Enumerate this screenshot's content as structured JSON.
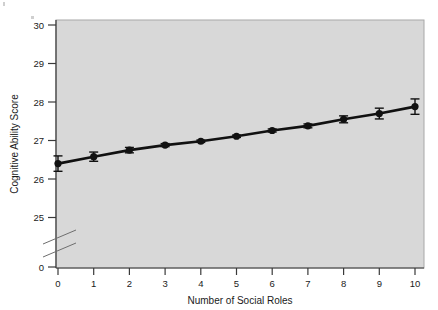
{
  "figure": {
    "background_color": "#ffffff",
    "plot_background_color": "#d8d8d8",
    "plot_border_color": "#9a9a9a",
    "axis_color": "#3a3a3a",
    "series_color": "#111111"
  },
  "axes": {
    "x_title": "Number of Social Roles",
    "y_title": "Cognitive Ability Score",
    "x_ticks": [
      "0",
      "1",
      "2",
      "3",
      "4",
      "5",
      "6",
      "7",
      "8",
      "9",
      "10"
    ],
    "y_ticks": [
      "30",
      "29",
      "28",
      "27",
      "26",
      "25",
      "0"
    ],
    "y_axis_break": true
  },
  "chart_data": {
    "type": "line",
    "title": "",
    "subtitle": "",
    "xlabel": "Number of Social Roles",
    "ylabel": "Cognitive Ability Score",
    "x": [
      0,
      1,
      2,
      3,
      4,
      5,
      6,
      7,
      8,
      9,
      10
    ],
    "values": [
      26.4,
      26.58,
      26.75,
      26.88,
      26.98,
      27.11,
      27.26,
      27.38,
      27.55,
      27.7,
      27.88
    ],
    "error_bars": [
      0.2,
      0.12,
      0.07,
      0.04,
      0.03,
      0.03,
      0.04,
      0.05,
      0.09,
      0.14,
      0.2
    ],
    "series": [
      {
        "name": "Cognitive Ability Score",
        "values": [
          26.4,
          26.58,
          26.75,
          26.88,
          26.98,
          27.11,
          27.26,
          27.38,
          27.55,
          27.7,
          27.88
        ],
        "error_bars": [
          0.2,
          0.12,
          0.07,
          0.04,
          0.03,
          0.03,
          0.04,
          0.05,
          0.09,
          0.14,
          0.2
        ]
      }
    ],
    "xlim": [
      0,
      10
    ],
    "ylim": [
      25,
      30
    ],
    "y_displayed_ticks": [
      0,
      25,
      26,
      27,
      28,
      29,
      30
    ],
    "y_axis_break_between": [
      0,
      25
    ],
    "grid": false,
    "legend": "none",
    "marker": "filled-circle",
    "annotations": []
  }
}
